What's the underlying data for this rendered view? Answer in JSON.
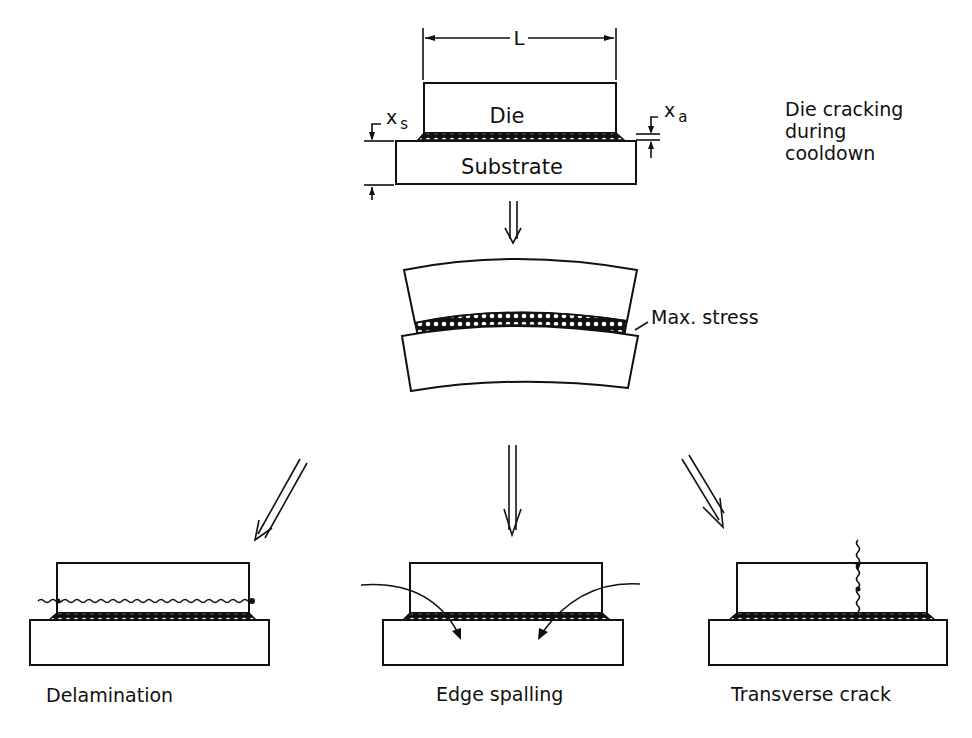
{
  "figure": {
    "top": {
      "dimension_label": "L",
      "die_label": "Die",
      "substrate_label": "Substrate",
      "xs_label": "x",
      "xs_sub": "s",
      "xa_label": "x",
      "xa_sub": "a",
      "caption_lines": [
        "Die cracking",
        "during",
        "cooldown"
      ]
    },
    "middle": {
      "callout_label": "Max. stress"
    },
    "failure_modes": [
      {
        "label": "Delamination"
      },
      {
        "label": "Edge spalling"
      },
      {
        "label": "Transverse crack"
      }
    ],
    "colors": {
      "ink": "#111111",
      "background": "#ffffff"
    }
  }
}
